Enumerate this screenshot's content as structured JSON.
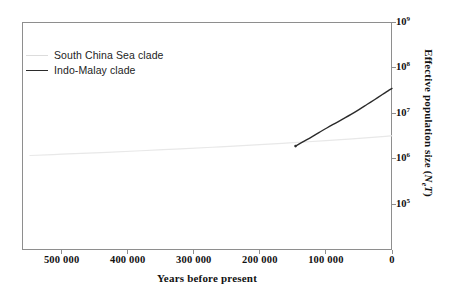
{
  "chart_data": {
    "type": "line",
    "title": "",
    "xlabel": "Years before present",
    "ylabel": "Effective population size (NeT)",
    "ylabel_parts": {
      "prefix": "Effective population size (",
      "symbol": "N",
      "subscript": "e",
      "symbol2": "T",
      "suffix": ")"
    },
    "x_axis": {
      "direction": "reversed",
      "min": 0,
      "max": 560000,
      "ticks": [
        500000,
        400000,
        300000,
        200000,
        100000,
        0
      ],
      "tick_labels": [
        "500 000",
        "400 000",
        "300 000",
        "200 000",
        "100 000",
        "0"
      ]
    },
    "y_axis": {
      "scale": "log",
      "min": 10000,
      "max": 1000000000,
      "ticks": [
        1000000000,
        100000000,
        10000000,
        1000000,
        100000
      ],
      "tick_labels": [
        "10⁹",
        "10⁸",
        "10⁷",
        "10⁶",
        "10⁵"
      ],
      "tick_mantissas": [
        "10",
        "10",
        "10",
        "10",
        "10"
      ],
      "tick_exponents": [
        "9",
        "8",
        "7",
        "6",
        "5"
      ],
      "position": "right"
    },
    "grid": false,
    "legend_position": "top-left",
    "series": [
      {
        "name": "South China Sea clade",
        "color": "#e8e8e8",
        "line_width": 1.2,
        "x": [
          548000,
          500000,
          440000,
          380000,
          320000,
          260000,
          200000,
          150000,
          100000,
          60000,
          30000,
          10000,
          0
        ],
        "y": [
          1180000,
          1260000,
          1370000,
          1500000,
          1650000,
          1830000,
          2050000,
          2260000,
          2500000,
          2740000,
          2950000,
          3100000,
          3200000
        ]
      },
      {
        "name": "Indo-Malay clade",
        "color": "#2b2b2b",
        "line_width": 1.4,
        "x": [
          146000,
          135000,
          122000,
          110000,
          98000,
          86000,
          74000,
          62000,
          50000,
          38000,
          26000,
          14000,
          6000,
          0
        ],
        "y": [
          1900000,
          2350000,
          3000000,
          3800000,
          4800000,
          6000000,
          7500000,
          9400000,
          12000000,
          15500000,
          20000000,
          26000000,
          31000000,
          35000000
        ]
      }
    ]
  },
  "legend": {
    "items": [
      {
        "label": "South China Sea clade",
        "color": "#dcdcdc"
      },
      {
        "label": "Indo-Malay clade",
        "color": "#2b2b2b"
      }
    ]
  },
  "axes": {
    "x_title": "Years before present",
    "x_tick_labels": [
      "500 000",
      "400 000",
      "300 000",
      "200 000",
      "100 000",
      "0"
    ],
    "y_tick_bases": [
      "10",
      "10",
      "10",
      "10",
      "10"
    ],
    "y_tick_exponents": [
      "9",
      "8",
      "7",
      "6",
      "5"
    ],
    "y_title_prefix": "Effective population size (",
    "y_title_symbol": "N",
    "y_title_sub": "e",
    "y_title_symbol2": "T",
    "y_title_suffix": ")"
  },
  "colors": {
    "frame": "#8e8e8e",
    "text": "#111111",
    "dark_series": "#2b2b2b",
    "faint_series": "#e4e4e4",
    "background": "#ffffff"
  }
}
